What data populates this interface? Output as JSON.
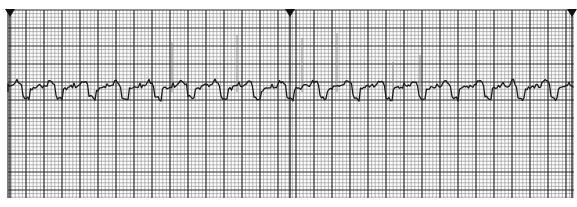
{
  "strip": {
    "type": "ecg-rhythm-strip",
    "grid": {
      "left": 8,
      "top": 10,
      "right": 574,
      "bottom": 198,
      "minor": 3.6,
      "major": 18,
      "minor_color": "#9a9a9a",
      "major_color": "#2a2a2a"
    },
    "markers": [
      10,
      290,
      572
    ],
    "trace_color": "#1a1a1a",
    "baseline_y": 92,
    "spikes": [
      {
        "x": 172,
        "top": 42
      },
      {
        "x": 237,
        "top": 35
      },
      {
        "x": 302,
        "top": 38
      },
      {
        "x": 337,
        "top": 33
      },
      {
        "x": 393,
        "top": 62
      },
      {
        "x": 420,
        "top": 55
      }
    ]
  }
}
